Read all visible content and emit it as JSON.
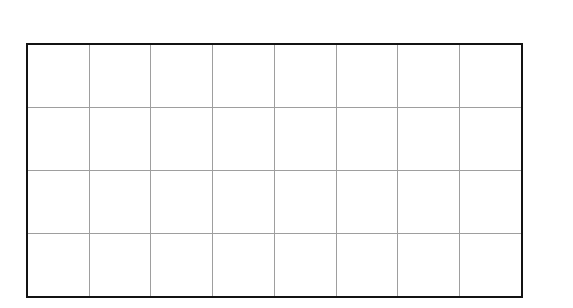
{
  "document": {
    "type": "blank-grid-table",
    "description": "Scanned blank grid table",
    "background_color": "#ffffff",
    "border_color": "#131313",
    "gridline_color": "#9e9e9e",
    "border_width_px": 2,
    "gridline_width_px": 1,
    "columns": 8,
    "rows": 4,
    "geometry": {
      "left_px": 26,
      "top_px": 43,
      "width_px": 497,
      "height_px": 255,
      "column_x_positions": [
        26,
        88,
        150,
        212,
        274,
        336,
        398,
        461,
        523
      ],
      "row_y_positions": [
        43,
        105,
        170,
        234,
        298
      ]
    },
    "cells": [
      [
        "",
        "",
        "",
        "",
        "",
        "",
        "",
        ""
      ],
      [
        "",
        "",
        "",
        "",
        "",
        "",
        "",
        ""
      ],
      [
        "",
        "",
        "",
        "",
        "",
        "",
        "",
        ""
      ],
      [
        "",
        "",
        "",
        "",
        "",
        "",
        "",
        ""
      ]
    ]
  }
}
